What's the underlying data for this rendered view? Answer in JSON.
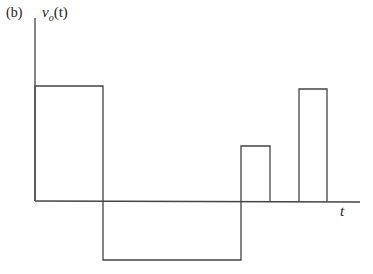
{
  "figure": {
    "panel_label": "(b)",
    "y_axis_label": "v_o(t)",
    "y_axis_label_main": "v",
    "y_axis_label_sub": "o",
    "y_axis_label_arg": "(t)",
    "x_axis_label": "t",
    "stroke_color": "#444444"
  },
  "waveform": {
    "type": "piecewise-constant pulses",
    "segments": [
      {
        "t_start": 0,
        "t_end": 68,
        "level": "positive, height ~115px"
      },
      {
        "t_start": 68,
        "t_end": 206,
        "level": "negative, depth ~59px"
      },
      {
        "t_start": 206,
        "t_end": 235,
        "level": "positive, height ~55px"
      },
      {
        "t_start": 235,
        "t_end": 264,
        "level": "zero"
      },
      {
        "t_start": 264,
        "t_end": 292,
        "level": "positive, height ~112px"
      }
    ]
  }
}
